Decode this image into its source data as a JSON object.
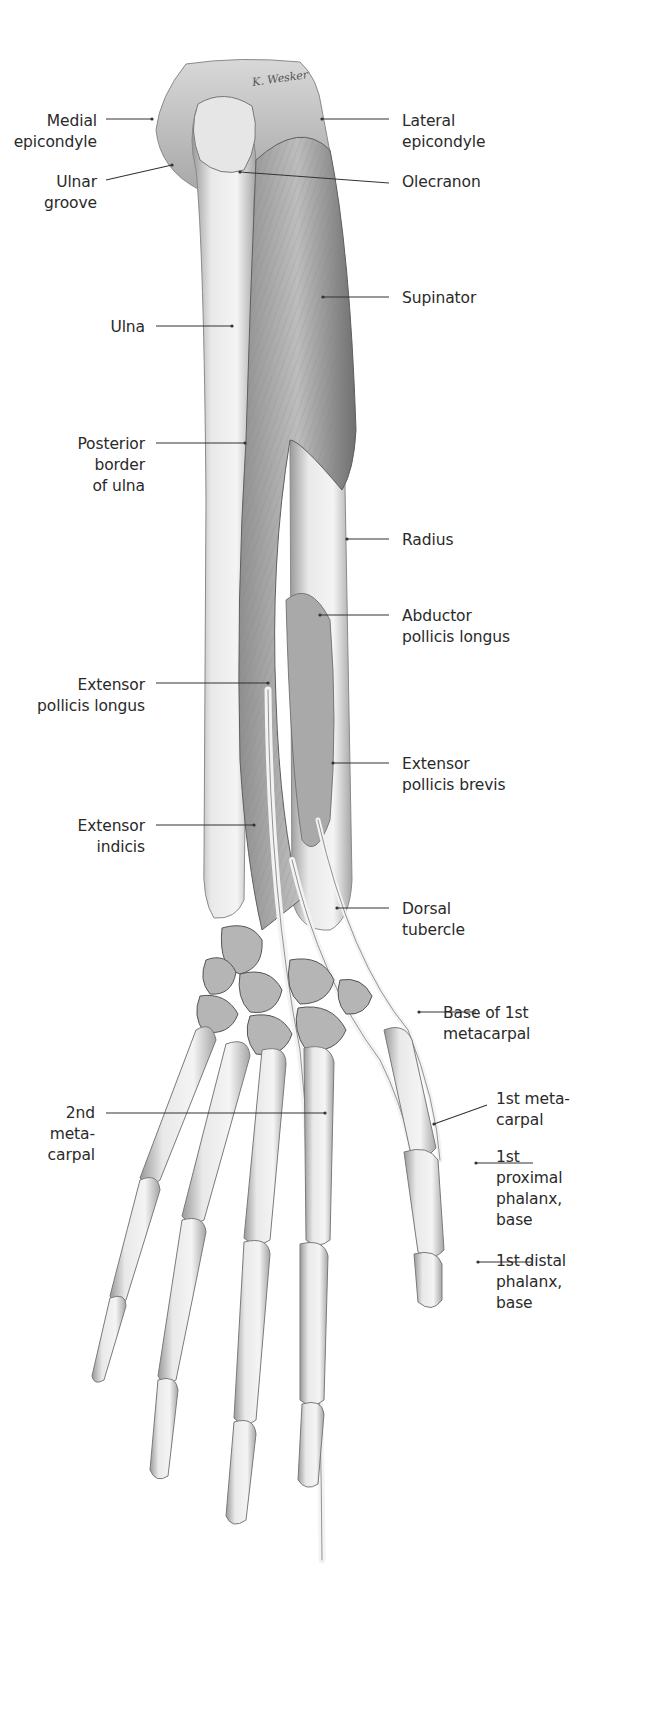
{
  "figure": {
    "signature": "K. Wesker",
    "colors": {
      "background": "#ffffff",
      "bone_light": "#eeeeee",
      "bone_mid": "#cfcfcf",
      "bone_dark": "#8a8a8a",
      "muscle_light": "#b9b9b9",
      "muscle_dark": "#6f6f6f",
      "tendon": "#f2f2f2",
      "leader": "#333333",
      "text": "#2a2a2a"
    }
  },
  "labels": [
    {
      "id": "medial-epicondyle",
      "side": "left",
      "text": "Medial\nepicondyle",
      "tx": 97,
      "ty": 111,
      "line": [
        106,
        119,
        152,
        119
      ]
    },
    {
      "id": "ulnar-groove",
      "side": "left",
      "text": "Ulnar\ngroove",
      "tx": 97,
      "ty": 172,
      "line": [
        106,
        180,
        172,
        165
      ]
    },
    {
      "id": "ulna",
      "side": "left",
      "text": "Ulna",
      "tx": 145,
      "ty": 317,
      "line": [
        156,
        326,
        232,
        326
      ]
    },
    {
      "id": "posterior-border-of-ulna",
      "side": "left",
      "text": "Posterior\nborder\nof ulna",
      "tx": 145,
      "ty": 434,
      "line": [
        156,
        443,
        245,
        443
      ]
    },
    {
      "id": "extensor-pollicis-longus",
      "side": "left",
      "text": "Extensor\npollicis longus",
      "tx": 145,
      "ty": 675,
      "line": [
        156,
        683,
        268,
        683
      ]
    },
    {
      "id": "extensor-indicis",
      "side": "left",
      "text": "Extensor\nindicis",
      "tx": 145,
      "ty": 816,
      "line": [
        156,
        825,
        254,
        825
      ]
    },
    {
      "id": "2nd-metacarpal",
      "side": "left",
      "text": "2nd\nmeta-\ncarpal",
      "tx": 95,
      "ty": 1103,
      "line": [
        106,
        1113,
        325,
        1113
      ]
    },
    {
      "id": "lateral-epicondyle",
      "side": "right",
      "text": "Lateral\nepicondyle",
      "tx": 402,
      "ty": 111,
      "line": [
        322,
        119,
        389,
        119
      ]
    },
    {
      "id": "olecranon",
      "side": "right",
      "text": "Olecranon",
      "tx": 402,
      "ty": 172,
      "line": [
        240,
        172,
        389,
        183
      ]
    },
    {
      "id": "supinator",
      "side": "right",
      "text": "Supinator",
      "tx": 402,
      "ty": 288,
      "line": [
        323,
        297,
        389,
        297
      ]
    },
    {
      "id": "radius",
      "side": "right",
      "text": "Radius",
      "tx": 402,
      "ty": 530,
      "line": [
        347,
        539,
        389,
        539
      ]
    },
    {
      "id": "abductor-pollicis-longus",
      "side": "right",
      "text": "Abductor\npollicis longus",
      "tx": 402,
      "ty": 606,
      "line": [
        320,
        615,
        389,
        615
      ]
    },
    {
      "id": "extensor-pollicis-brevis",
      "side": "right",
      "text": "Extensor\npollicis brevis",
      "tx": 402,
      "ty": 754,
      "line": [
        333,
        763,
        389,
        763
      ]
    },
    {
      "id": "dorsal-tubercle",
      "side": "right",
      "text": "Dorsal\ntubercle",
      "tx": 402,
      "ty": 899,
      "line": [
        337,
        908,
        389,
        908
      ]
    },
    {
      "id": "base-of-1st-metacarpal",
      "side": "right",
      "text": "Base of 1st\nmetacarpal",
      "tx": 443,
      "ty": 1003,
      "line": [
        419,
        1012,
        476,
        1012
      ]
    },
    {
      "id": "1st-metacarpal",
      "side": "right",
      "text": "1st meta-\ncarpal",
      "tx": 496,
      "ty": 1089,
      "line": [
        434,
        1124,
        487,
        1105
      ]
    },
    {
      "id": "1st-proximal-phalanx-base",
      "side": "right",
      "text": "1st\nproximal\nphalanx,\nbase",
      "tx": 496,
      "ty": 1147,
      "line": [
        476,
        1163,
        533,
        1163
      ]
    },
    {
      "id": "1st-distal-phalanx-base",
      "side": "right",
      "text": "1st distal\nphalanx,\nbase",
      "tx": 496,
      "ty": 1251,
      "line": [
        478,
        1262,
        533,
        1262
      ]
    }
  ]
}
